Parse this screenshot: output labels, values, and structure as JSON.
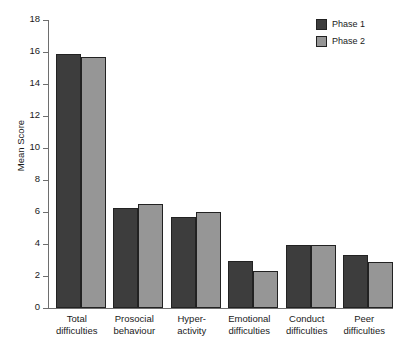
{
  "chart_data": {
    "type": "bar",
    "title": "",
    "xlabel": "",
    "ylabel": "Mean Score",
    "ylim": [
      0,
      18
    ],
    "ytick_step": 2,
    "yticks": [
      "18",
      "16",
      "14",
      "12",
      "10",
      "8",
      "6",
      "4",
      "2",
      "0"
    ],
    "grid": false,
    "legend_position": "top-right",
    "categories": [
      "Total difficulties",
      "Prosocial behaviour",
      "Hyper-activity",
      "Emotional difficulties",
      "Conduct difficulties",
      "Peer difficulties"
    ],
    "category_lines": [
      [
        "Total",
        "difficulties"
      ],
      [
        "Prosocial",
        "behaviour"
      ],
      [
        "Hyper-",
        "activity"
      ],
      [
        "Emotional",
        "difficulties"
      ],
      [
        "Conduct",
        "difficulties"
      ],
      [
        "Peer",
        "difficulties"
      ]
    ],
    "series": [
      {
        "name": "Phase 1",
        "color": "#3d3d3d",
        "values": [
          15.85,
          6.25,
          5.7,
          2.95,
          3.95,
          3.3
        ]
      },
      {
        "name": "Phase 2",
        "color": "#969696",
        "values": [
          15.7,
          6.5,
          6.0,
          2.3,
          3.95,
          2.9
        ]
      }
    ]
  },
  "colors": {
    "axis": "#6e6e6e",
    "text": "#1a1a1a",
    "background": "#ffffff",
    "phase1": "#3d3d3d",
    "phase2": "#969696"
  }
}
